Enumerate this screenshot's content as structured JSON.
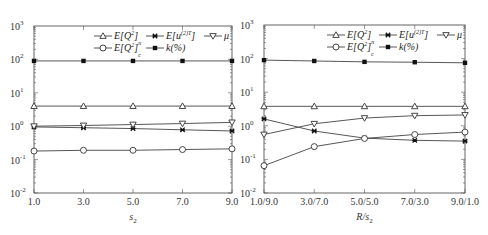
{
  "chart_data": [
    {
      "type": "line",
      "title": "",
      "xlabel": "s2",
      "ylabel": "",
      "yscale": "log",
      "ylim": [
        0.01,
        1000
      ],
      "y_tick_labels": [
        "10^-2",
        "10^-1",
        "10^0",
        "10^1",
        "10^2",
        "10^3"
      ],
      "categories": [
        "1.0",
        "3.0",
        "5.0",
        "7.0",
        "9.0"
      ],
      "legend_position": "upper right",
      "grid": false,
      "series": [
        {
          "name": "E[Q^2]_n",
          "marker": "triangle-up",
          "values": [
            4.0,
            4.0,
            4.0,
            4.0,
            4.0
          ]
        },
        {
          "name": "E[u^(2)T]",
          "marker": "x-square",
          "values": [
            0.95,
            0.9,
            0.85,
            0.78,
            0.72
          ]
        },
        {
          "name": "mu",
          "marker": "triangle-down",
          "values": [
            1.0,
            1.05,
            1.12,
            1.2,
            1.3
          ]
        },
        {
          "name": "E[Q^2]_c",
          "marker": "circle",
          "values": [
            0.18,
            0.19,
            0.19,
            0.2,
            0.21
          ]
        },
        {
          "name": "k(%)",
          "marker": "filled-square",
          "values": [
            90,
            90,
            90,
            90,
            90
          ]
        }
      ]
    },
    {
      "type": "line",
      "title": "",
      "xlabel": "R/s2",
      "ylabel": "",
      "yscale": "log",
      "ylim": [
        0.01,
        1000
      ],
      "y_tick_labels": [
        "10^-2",
        "10^-1",
        "10^0",
        "10^1",
        "10^2",
        "10^3"
      ],
      "categories": [
        "1.0/9.0",
        "3.0/7.0",
        "5.0/5.0",
        "7.0/3.0",
        "9.0/1.0"
      ],
      "legend_position": "upper right",
      "grid": false,
      "series": [
        {
          "name": "E[Q^2]_n",
          "marker": "triangle-up",
          "values": [
            3.8,
            3.8,
            3.8,
            3.8,
            3.8
          ]
        },
        {
          "name": "E[u^(2)T]",
          "marker": "x-square",
          "values": [
            1.6,
            0.7,
            0.43,
            0.37,
            0.35
          ]
        },
        {
          "name": "mu",
          "marker": "triangle-down",
          "values": [
            0.55,
            1.15,
            1.7,
            2.0,
            2.1
          ]
        },
        {
          "name": "E[Q^2]_c",
          "marker": "circle",
          "values": [
            0.065,
            0.24,
            0.42,
            0.55,
            0.65
          ]
        },
        {
          "name": "k(%)",
          "marker": "filled-square",
          "values": [
            90,
            85,
            80,
            78,
            75
          ]
        }
      ]
    }
  ],
  "charts": [
    {
      "xlabel": "s",
      "xlabel_sub": "2",
      "xticks": [
        "1.0",
        "3.0",
        "5.0",
        "7.0",
        "9.0"
      ],
      "legend": {
        "qn": "E[Q",
        "qn_sup": "2",
        "qn_sub": "]n",
        "u": "E[u",
        "u_sup": "(2)T",
        "u_end": "]",
        "mu": "μ",
        "qc": "E[Q",
        "qc_sup": "2",
        "qc_sub": "]c",
        "k": "k(%)"
      }
    },
    {
      "xlabel": "R/s",
      "xlabel_sub": "2",
      "xticks": [
        "1.0/9.0",
        "3.0/7.0",
        "5.0/5.0",
        "7.0/3.0",
        "9.0/1.0"
      ],
      "legend": {
        "qn": "E[Q",
        "qn_sup": "2",
        "qn_sub": "]n",
        "u": "E[u",
        "u_sup": "(2)T",
        "u_end": "]",
        "mu": "μ",
        "qc": "E[Q",
        "qc_sup": "2",
        "qc_sub": "]c",
        "k": "k(%)"
      }
    }
  ],
  "y_ticks": [
    {
      "base": "10",
      "exp": "3"
    },
    {
      "base": "10",
      "exp": "2"
    },
    {
      "base": "10",
      "exp": "1"
    },
    {
      "base": "10",
      "exp": "0"
    },
    {
      "base": "10",
      "exp": "-1"
    },
    {
      "base": "10",
      "exp": "-2"
    }
  ]
}
